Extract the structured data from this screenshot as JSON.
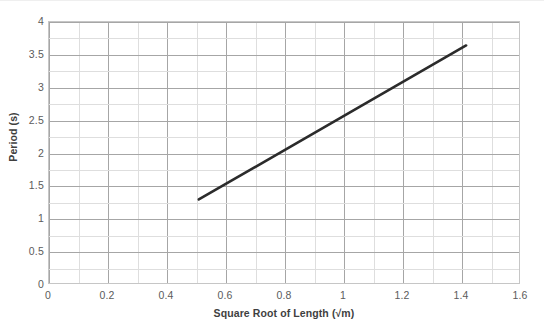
{
  "chart_data": {
    "type": "line",
    "title": "",
    "xlabel": "Square Root of Length (√m)",
    "ylabel": "Period (s)",
    "xlim": [
      0,
      1.6
    ],
    "ylim": [
      0,
      4
    ],
    "grid": true,
    "legend": "none",
    "x_major_ticks": [
      "0",
      "0.2",
      "0.4",
      "0.6",
      "0.8",
      "1",
      "1.2",
      "1.4",
      "1.6"
    ],
    "x_major_values": [
      0,
      0.2,
      0.4,
      0.6,
      0.8,
      1,
      1.2,
      1.4,
      1.6
    ],
    "x_minor_step": 0.1,
    "y_major_ticks": [
      "0",
      "0.5",
      "1",
      "1.5",
      "2",
      "2.5",
      "3",
      "3.5",
      "4"
    ],
    "y_major_values": [
      0,
      0.5,
      1,
      1.5,
      2,
      2.5,
      3,
      3.5,
      4
    ],
    "y_minor_step": 0.25,
    "series": [
      {
        "name": "Period vs Square Root of Length",
        "color": "#2b2b2b",
        "line_width": 2.6,
        "x": [
          0.51,
          1.42
        ],
        "y": [
          1.28,
          3.64
        ]
      }
    ]
  }
}
